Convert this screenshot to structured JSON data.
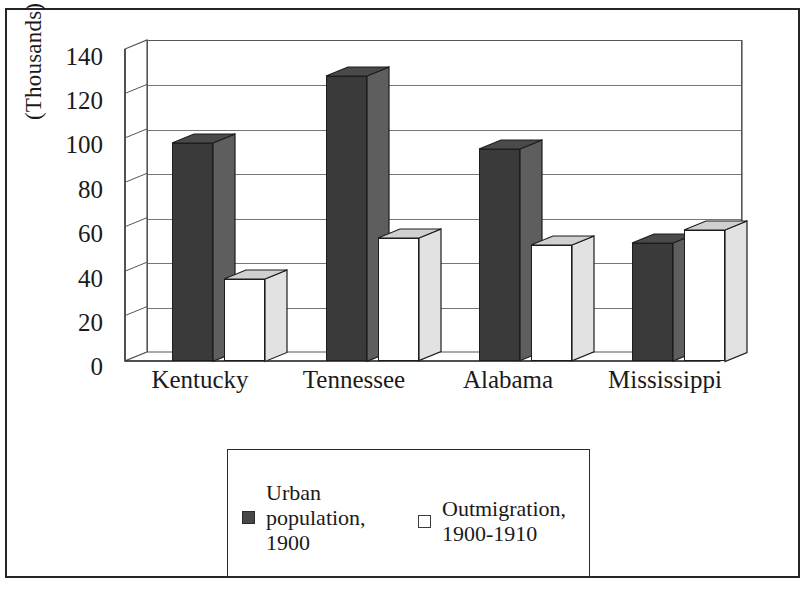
{
  "chart_data": {
    "type": "bar",
    "title": "",
    "subtitle": "",
    "xlabel": "",
    "ylabel": "(Thousands)",
    "categories": [
      "Kentucky",
      "Tennessee",
      "Alabama",
      "Mississippi"
    ],
    "series": [
      {
        "name": "Urban population, 1900",
        "color": "#3a3a3a",
        "values": [
          98,
          128,
          95,
          53
        ]
      },
      {
        "name": "Outmigration, 1900-1910",
        "color": "#ffffff",
        "values": [
          37,
          55,
          52,
          59
        ]
      }
    ],
    "ylim": [
      0,
      140
    ],
    "yticks": [
      0,
      20,
      40,
      60,
      80,
      100,
      120,
      140
    ],
    "ytick_labels": [
      "0",
      "20",
      "40",
      "60",
      "80",
      "100",
      "120",
      "140"
    ],
    "grid": true,
    "grid_axis": "y",
    "legend_position": "bottom",
    "style": "3d-column",
    "border": true
  },
  "axis": {
    "y_label": "(Thousands)",
    "ticks": {
      "t140": "140",
      "t120": "120",
      "t100": "100",
      "t80": "80",
      "t60": "60",
      "t40": "40",
      "t20": "20",
      "t0": "0"
    }
  },
  "categories": {
    "c0": "Kentucky",
    "c1": "Tennessee",
    "c2": "Alabama",
    "c3": "Mississippi"
  },
  "legend": {
    "items": [
      {
        "label": "Urban\npopulation,\n1900",
        "line1": "Urban",
        "line2": "population,",
        "line3": "1900",
        "swatch": "dark-filled-square"
      },
      {
        "label": "Outmigration,\n1900-1910",
        "line1": "Outmigration,",
        "line2": "1900-1910",
        "swatch": "white-outlined-square"
      }
    ]
  }
}
